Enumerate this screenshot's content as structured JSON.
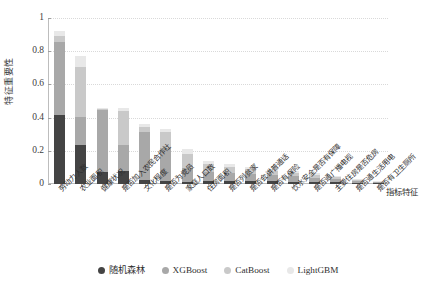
{
  "chart_data": {
    "type": "bar",
    "stacked": true,
    "title": "",
    "xlabel": "指标特征",
    "ylabel": "特征重要性",
    "ylim": [
      0,
      1
    ],
    "yticks": [
      "0",
      "0.2",
      "0.4",
      "0.6",
      "0.8",
      "1"
    ],
    "grid": true,
    "legend_position": "bottom",
    "categories": [
      "劳动力人数",
      "农业面积",
      "健康状况",
      "是否加入农民合作社",
      "文化程度",
      "是否为党员",
      "家庭人口数",
      "住房面积",
      "是否列贫家",
      "是否会讲普通话",
      "是否有保险",
      "饮水安全是否有保障",
      "是否通广播电视",
      "主要住房是否危房",
      "是否通生活用电",
      "是否有卫生厕所"
    ],
    "series": [
      {
        "name": "随机森林",
        "color": "#444444",
        "values": [
          0.415,
          0.235,
          0.07,
          0.08,
          0.023,
          0.02,
          0.013,
          0.02,
          0.019,
          0.018,
          0.016,
          0.015,
          0.013,
          0.01,
          0.008,
          0.006
        ]
      },
      {
        "name": "XGBoost",
        "color": "#a8a8a8",
        "values": [
          0.443,
          0.17,
          0.375,
          0.158,
          0.288,
          0.2,
          0.085,
          0.053,
          0.048,
          0.042,
          0.038,
          0.031,
          0.026,
          0.018,
          0.01,
          0.005
        ]
      },
      {
        "name": "CatBoost",
        "color": "#c9c9c9",
        "values": [
          0.035,
          0.3,
          0.005,
          0.2,
          0.03,
          0.095,
          0.085,
          0.047,
          0.035,
          0.03,
          0.026,
          0.022,
          0.017,
          0.014,
          0.008,
          0.004
        ]
      },
      {
        "name": "LightGBM",
        "color": "#e8e8e8",
        "values": [
          0.027,
          0.065,
          0.005,
          0.02,
          0.022,
          0.018,
          0.03,
          0.02,
          0.018,
          0.015,
          0.013,
          0.01,
          0.008,
          0.006,
          0.004,
          0.002
        ]
      }
    ],
    "totals": [
      0.92,
      0.77,
      0.455,
      0.458,
      0.363,
      0.333,
      0.213,
      0.14,
      0.12,
      0.105,
      0.093,
      0.078,
      0.064,
      0.048,
      0.03,
      0.017
    ]
  },
  "legend": {
    "items": [
      {
        "label": "随机森林",
        "color": "#444444"
      },
      {
        "label": "XGBoost",
        "color": "#a8a8a8"
      },
      {
        "label": "CatBoost",
        "color": "#c9c9c9"
      },
      {
        "label": "LightGBM",
        "color": "#e8e8e8"
      }
    ]
  }
}
